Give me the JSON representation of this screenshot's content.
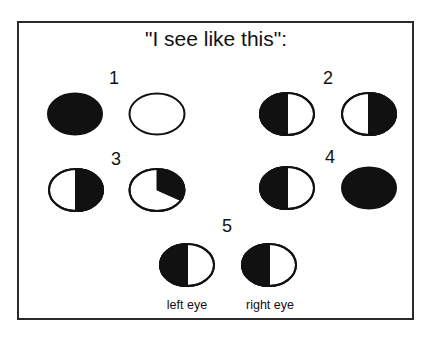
{
  "title": "\"I see like this\":",
  "panels": [
    {
      "label": "1",
      "left_eye": "fully dark",
      "right_eye": "fully clear"
    },
    {
      "label": "2",
      "left_eye": "left half dark",
      "right_eye": "right half dark"
    },
    {
      "label": "3",
      "left_eye": "right half dark",
      "right_eye": "upper-right wedge dark"
    },
    {
      "label": "4",
      "left_eye": "left half dark",
      "right_eye": "fully dark"
    },
    {
      "label": "5",
      "left_eye": "left half dark",
      "right_eye": "left half dark"
    }
  ],
  "captions": {
    "left": "left eye",
    "right": "right eye"
  },
  "colors": {
    "ink": "#111111",
    "background": "#ffffff"
  }
}
